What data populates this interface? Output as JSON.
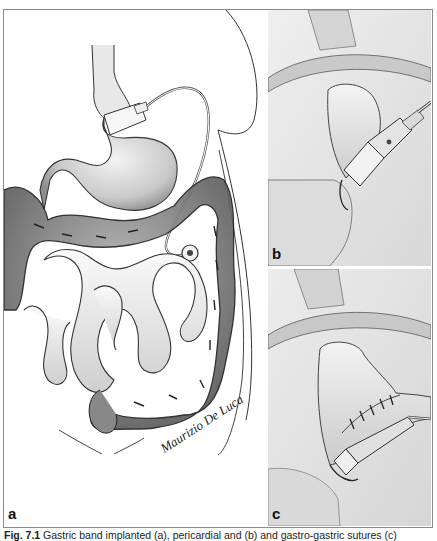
{
  "figure": {
    "panels": [
      {
        "id": "a",
        "label": "a",
        "description": "Abdominal overview: stomach with adjustable gastric band, tubing to access port, colon and small intestine"
      },
      {
        "id": "b",
        "label": "b",
        "description": "Close-up of gastric band placed around upper stomach"
      },
      {
        "id": "c",
        "label": "c",
        "description": "Close-up of band with gastro-gastric sutures"
      }
    ],
    "signature": "Maurizio De Luca",
    "caption": {
      "number": "Fig. 7.1",
      "text": "Gastric band implanted (a), pericardial and (b) and gastro-gastric sutures (c)"
    },
    "colors": {
      "frame": "#8a8a8a",
      "ink": "#222222",
      "organ_shade": "#9a9a9a",
      "panel_bg": "#e8e8e8"
    }
  }
}
